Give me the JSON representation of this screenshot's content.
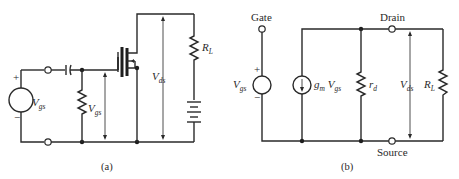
{
  "figure_a": {
    "caption": "(a)",
    "source_label": {
      "main": "V",
      "sub": "gs"
    },
    "source_plus": "+",
    "source_minus": "−",
    "gate_voltage_label": {
      "main": "V",
      "sub": "gs"
    },
    "drain_voltage_label": {
      "main": "V",
      "sub": "ds"
    },
    "load_label": {
      "main": "R",
      "sub": "L"
    }
  },
  "figure_b": {
    "caption": "(b)",
    "gate_label": "Gate",
    "drain_label": "Drain",
    "source_label": "Source",
    "input_label": {
      "main": "V",
      "sub": "gs"
    },
    "input_plus": "+",
    "input_minus": "−",
    "current_source_label": {
      "g": "g",
      "gsub": "m",
      "main": " V",
      "sub": "gs"
    },
    "rd_label": {
      "main": "r",
      "sub": "d"
    },
    "vds_label": {
      "main": "V",
      "sub": "ds"
    },
    "load_label": {
      "main": "R",
      "sub": "L"
    }
  }
}
